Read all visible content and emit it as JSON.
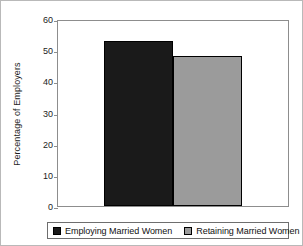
{
  "chart_data": {
    "type": "bar",
    "title": "",
    "xlabel": "",
    "ylabel": "Percentage of Employers",
    "categories": [
      "Employing Married Women",
      "Retaining Married Women"
    ],
    "values": [
      53,
      48
    ],
    "ylim": [
      0,
      60
    ],
    "yticks": [
      0,
      10,
      20,
      30,
      40,
      50,
      60
    ],
    "ytick_labels": [
      "0",
      "10",
      "20",
      "30",
      "40",
      "50",
      "60"
    ],
    "grid": false,
    "legend_position": "bottom",
    "series": [
      {
        "name": "Employing Married Women",
        "value": 53,
        "color": "#1a1a1a"
      },
      {
        "name": "Retaining Married Women",
        "value": 48,
        "color": "#9b9b9b"
      }
    ]
  },
  "legend": {
    "items": [
      {
        "label": "Employing Married Women",
        "swatch": "black-square-swatch"
      },
      {
        "label": "Retaining Married Women",
        "swatch": "gray-square-swatch"
      }
    ]
  },
  "colors": {
    "bar_employing": "#1a1a1a",
    "bar_retaining": "#9b9b9b",
    "axis": "#8d8d8d",
    "frame": "#b9b9b9",
    "text": "#1c1c1c"
  }
}
